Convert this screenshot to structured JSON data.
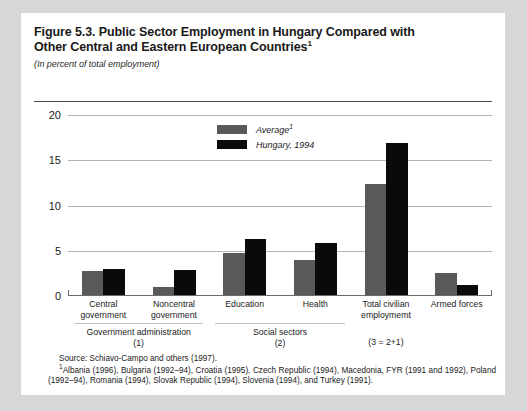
{
  "figure": {
    "title_line1": "Figure 5.3. Public Sector Employment in Hungary Compared with",
    "title_line2": "Other Central and Eastern European Countries",
    "title_superscript": "1",
    "subtitle": "(In percent of total employment)"
  },
  "legend": {
    "items": [
      {
        "label": "Average",
        "superscript": "1",
        "color": "#595959",
        "key": "average"
      },
      {
        "label": "Hungary, 1994",
        "superscript": "",
        "color": "#0a0a0a",
        "key": "hungary"
      }
    ]
  },
  "axis": {
    "y_ticks": [
      "0",
      "5",
      "10",
      "15",
      "20"
    ],
    "y_min": 0,
    "y_max": 20
  },
  "categories": [
    {
      "line1": "Central",
      "line2": "government"
    },
    {
      "line1": "Noncentral",
      "line2": "government"
    },
    {
      "line1": "Education",
      "line2": ""
    },
    {
      "line1": "Health",
      "line2": ""
    },
    {
      "line1": "Total civilian",
      "line2": "employmemt"
    },
    {
      "line1": "Armed forces",
      "line2": ""
    }
  ],
  "group_labels": [
    {
      "line1": "Government administration",
      "line2": "(1)"
    },
    {
      "line1": "Social sectors",
      "line2": "(2)"
    },
    {
      "line1": "",
      "line2": "(3 = 2+1)"
    }
  ],
  "notes": {
    "source": "Source:  Schiavo-Campo and others (1997).",
    "footnote_marker": "1",
    "footnote": "Albania (1996), Bulgaria (1992–94), Croatia (1995), Czech Republic (1994), Macedonia, FYR (1991 and 1992), Poland (1992–94), Romania (1994), Slovak Republic (1994), Slovenia (1994), and Turkey (1991)."
  },
  "colors": {
    "page_background": "#d7d7d7",
    "sheet_background": "#ffffff",
    "average_bar": "#595959",
    "hungary_bar": "#0a0a0a",
    "gridline": "#b4b4b4",
    "axis": "#6b6b6b"
  },
  "chart_data": {
    "type": "bar",
    "title": "Figure 5.3. Public Sector Employment in Hungary Compared with Other Central and Eastern European Countries",
    "subtitle": "(In percent of total employment)",
    "xlabel": "",
    "ylabel": "In percent of total employment",
    "ylim": [
      0,
      20
    ],
    "yticks": [
      0,
      5,
      10,
      15,
      20
    ],
    "grid": true,
    "legend_position": "top-center",
    "categories": [
      "Central government",
      "Noncentral government",
      "Education",
      "Health",
      "Total civilian employmemt",
      "Armed forces"
    ],
    "series": [
      {
        "name": "Average",
        "color": "#595959",
        "values": [
          2.8,
          1.0,
          4.8,
          4.0,
          12.4,
          2.5
        ]
      },
      {
        "name": "Hungary, 1994",
        "color": "#0a0a0a",
        "values": [
          3.0,
          2.9,
          6.3,
          5.9,
          16.9,
          1.2
        ]
      }
    ]
  }
}
